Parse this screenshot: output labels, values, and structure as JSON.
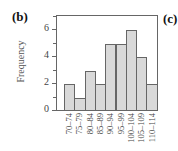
{
  "panels": {
    "left_label": "(b)",
    "right_label": "(c)"
  },
  "colors": {
    "bar_fill": "#d9d9d9",
    "bar_edge": "#666666",
    "axis": "#666666"
  },
  "chart_data": {
    "type": "bar",
    "title": "",
    "xlabel": "",
    "ylabel": "Frequency",
    "categories": [
      "70–74",
      "75–79",
      "80–84",
      "85–89",
      "90–94",
      "95–99",
      "100–104",
      "105–109",
      "110–114"
    ],
    "values": [
      2,
      1,
      3,
      2,
      5,
      5,
      6,
      4,
      2
    ],
    "yticks": [
      0,
      2,
      4,
      6
    ],
    "ylim": [
      0,
      7
    ],
    "grid": false,
    "legend": null
  }
}
